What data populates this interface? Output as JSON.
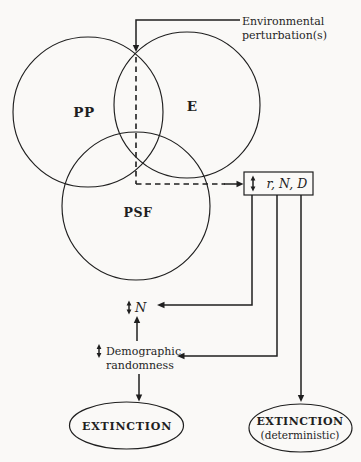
{
  "figure": {
    "colors": {
      "ink": "#1f1f1f",
      "paper": "#faf9f7"
    },
    "venn": {
      "pp_label": "PP",
      "e_label": "E",
      "psf_label": "PSF"
    },
    "environmental_perturbations": {
      "line1": "Environmental",
      "line2": "perturbation(s)"
    },
    "rnd_box": {
      "icon": "up-down-arrow",
      "label": "r, N, D"
    },
    "n_node": {
      "icon": "up-down-arrow",
      "label": "N"
    },
    "demographic_randomness": {
      "icon": "up-down-arrow",
      "line1": "Demographic",
      "line2": "randomness"
    },
    "extinction": {
      "label": "EXTINCTION"
    },
    "extinction_deterministic": {
      "line1": "EXTINCTION",
      "line2": "(deterministic)"
    }
  }
}
